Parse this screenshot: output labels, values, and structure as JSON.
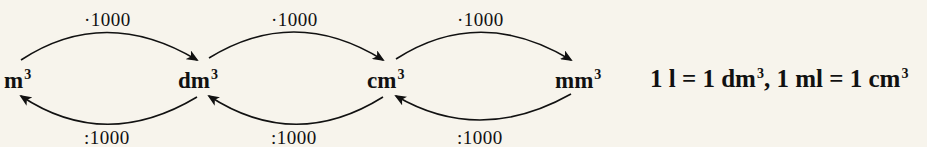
{
  "background_color": "#f7f4ec",
  "text_color": "#111111",
  "units": [
    {
      "base": "m",
      "exp": "3"
    },
    {
      "base": "dm",
      "exp": "3"
    },
    {
      "base": "cm",
      "exp": "3"
    },
    {
      "base": "mm",
      "exp": "3"
    }
  ],
  "conversions": {
    "forward": [
      {
        "from": "m³",
        "to": "dm³",
        "label": "·1000"
      },
      {
        "from": "dm³",
        "to": "cm³",
        "label": "·1000"
      },
      {
        "from": "cm³",
        "to": "mm³",
        "label": "·1000"
      }
    ],
    "backward": [
      {
        "from": "dm³",
        "to": "m³",
        "label": ":1000"
      },
      {
        "from": "cm³",
        "to": "dm³",
        "label": ":1000"
      },
      {
        "from": "mm³",
        "to": "cm³",
        "label": ":1000"
      }
    ]
  },
  "equation": {
    "part1": "1 l = 1 dm",
    "exp1": "3",
    "sep": ", ",
    "part2": "1 ml = 1 cm",
    "exp2": "3"
  }
}
